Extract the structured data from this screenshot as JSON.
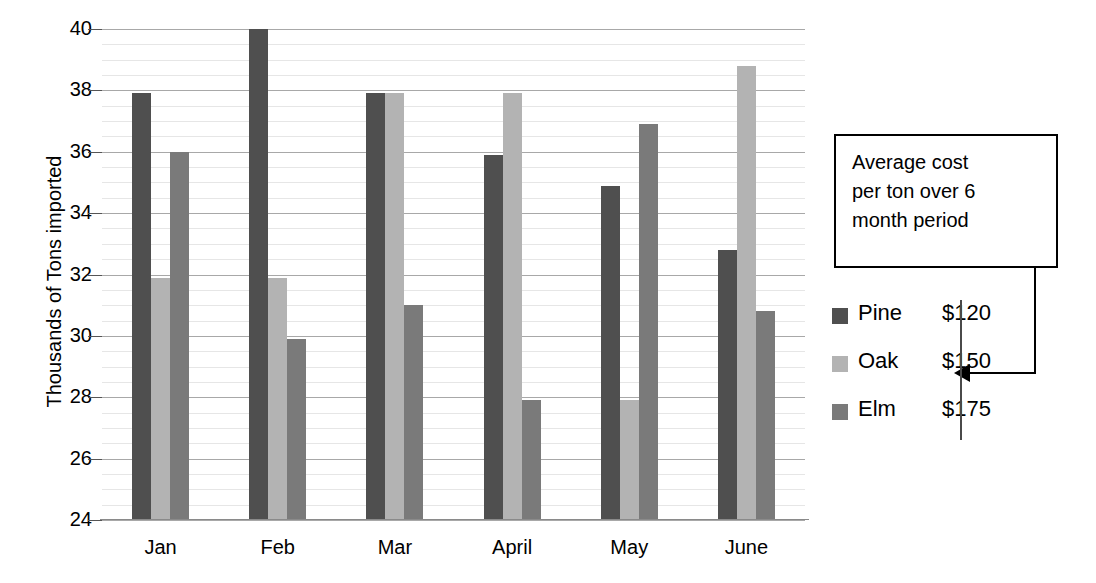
{
  "chart_data": {
    "type": "bar",
    "title": "",
    "xlabel": "",
    "ylabel": "Thousands of Tons imported",
    "ylim": [
      24,
      40
    ],
    "ytick_step": 2,
    "yticks": [
      24,
      26,
      28,
      30,
      32,
      34,
      36,
      38,
      40
    ],
    "minor_grid_step": 0.5,
    "grid": true,
    "legend_position": "right",
    "categories": [
      "Jan",
      "Feb",
      "Mar",
      "April",
      "May",
      "June"
    ],
    "series": [
      {
        "name": "Pine",
        "color": "#4f4f4f",
        "values": [
          37.9,
          40.0,
          37.9,
          35.9,
          34.9,
          32.8
        ]
      },
      {
        "name": "Oak",
        "color": "#b3b3b3",
        "values": [
          31.9,
          31.9,
          37.9,
          37.9,
          27.9,
          38.8
        ]
      },
      {
        "name": "Elm",
        "color": "#7a7a7a",
        "values": [
          36.0,
          29.9,
          31.0,
          27.9,
          36.9,
          30.8
        ]
      }
    ],
    "annotations": [
      {
        "name": "average-cost-callout",
        "text": "Average cost per ton over 6 month period",
        "lines": [
          "Average cost",
          "per ton over 6",
          "month period"
        ],
        "points_to": "legend-cost-column"
      }
    ]
  },
  "axis": {
    "y_title": "Thousands of Tons imported",
    "y_tick_labels": [
      "40",
      "38",
      "36",
      "34",
      "32",
      "30",
      "28",
      "26",
      "24"
    ],
    "x_tick_labels": [
      "Jan",
      "Feb",
      "Mar",
      "April",
      "May",
      "June"
    ]
  },
  "callout": {
    "line1": "Average cost",
    "line2": "per ton over 6",
    "line3": "month period"
  },
  "legend": {
    "rows": [
      {
        "name": "Pine",
        "cost": "$120",
        "swatch": "pine"
      },
      {
        "name": "Oak",
        "cost": "$150",
        "swatch": "oak"
      },
      {
        "name": "Elm",
        "cost": "$175",
        "swatch": "elm"
      }
    ]
  },
  "colors": {
    "pine": "#4f4f4f",
    "oak": "#b3b3b3",
    "elm": "#7a7a7a",
    "grid_major": "#a8a8a8",
    "grid_minor": "#e6e6e6",
    "axis": "#8a8a8a"
  }
}
